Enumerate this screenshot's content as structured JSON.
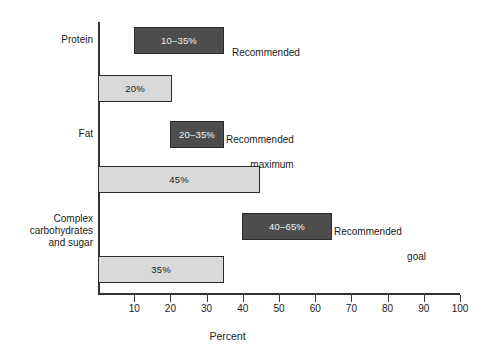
{
  "chart_data": {
    "type": "bar",
    "orientation": "horizontal",
    "title": "",
    "xlabel": "Percent",
    "ylabel": "",
    "xlim": [
      0,
      100
    ],
    "xticks": [
      10,
      20,
      30,
      40,
      50,
      60,
      70,
      80,
      90,
      100
    ],
    "xtick_labels": [
      "10",
      "20",
      "30",
      "40",
      "50",
      "60",
      "70",
      "80",
      "90",
      "100"
    ],
    "grid": false,
    "legend": "none",
    "categories": [
      "Protein",
      "Fat",
      "Complex\ncarbohydrates\nand sugar"
    ],
    "series": [
      {
        "name": "Recommended range",
        "style": "dark",
        "color": "#4d4d4d",
        "values": [
          [
            10,
            35
          ],
          [
            20,
            35
          ],
          [
            40,
            65
          ]
        ],
        "labels": [
          "10–35%",
          "20–35%",
          "40–65%"
        ],
        "annotations": [
          "Recommended",
          "Recommended\nmaximum",
          "Recommended\ngoal"
        ]
      },
      {
        "name": "Current intake",
        "style": "light",
        "color": "#d9d9d9",
        "values": [
          20,
          45,
          35
        ],
        "labels": [
          "20%",
          "45%",
          "35%"
        ]
      }
    ]
  },
  "categories": {
    "protein": "Protein",
    "fat": "Fat",
    "carbs_line1": "Complex",
    "carbs_line2": "carbohydrates",
    "carbs_line3": "and sugar"
  },
  "bars": {
    "protein_range": "10–35%",
    "protein_actual": "20%",
    "fat_range": "20–35%",
    "fat_actual": "45%",
    "carbs_range": "40–65%",
    "carbs_actual": "35%"
  },
  "annotations": {
    "protein": "Recommended",
    "fat_line1": "Recommended",
    "fat_line2": "maximum",
    "carbs_line1": "Recommended",
    "carbs_line2": "goal"
  },
  "axis": {
    "x_title": "Percent",
    "ticks": [
      "10",
      "20",
      "30",
      "40",
      "50",
      "60",
      "70",
      "80",
      "90",
      "100"
    ]
  }
}
